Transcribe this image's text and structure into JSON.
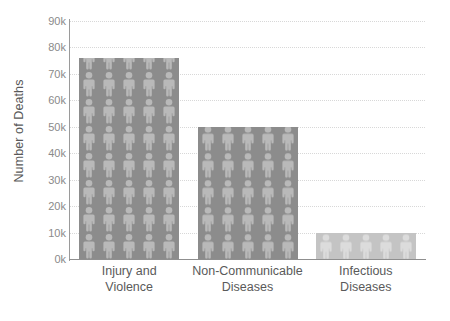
{
  "chart_data": {
    "type": "bar",
    "title": "",
    "subtitle": "",
    "xlabel": "",
    "ylabel": "Number of Deaths",
    "categories": [
      "Injury and Violence",
      "Non-Communicable Diseases",
      "Infectious Diseases"
    ],
    "category_lines": [
      [
        "Injury and",
        "Violence"
      ],
      [
        "Non-Communicable",
        "Diseases"
      ],
      [
        "Infectious",
        "Diseases"
      ]
    ],
    "values": [
      76000,
      50000,
      10000
    ],
    "value_labels": [
      "76k",
      "50k",
      "10k"
    ],
    "ylim": [
      0,
      90000
    ],
    "ytick_values": [
      0,
      10000,
      20000,
      30000,
      40000,
      50000,
      60000,
      70000,
      80000,
      90000
    ],
    "ytick_labels": [
      "0k",
      "10k",
      "20k",
      "30k",
      "40k",
      "50k",
      "60k",
      "70k",
      "80k",
      "90k"
    ],
    "grid": true,
    "grid_style": "dotted",
    "legend": false,
    "legend_position": "none",
    "bar_fill_pattern": "person-pictogram",
    "bar_colors": [
      "#8c8c8c",
      "#8c8c8c",
      "#c4c4c4"
    ],
    "pictogram_colors": [
      "#b9b9b9",
      "#b9b9b9",
      "#dcdcdc"
    ],
    "grid_color": "#d8d8d8",
    "axis_color": "#8f8f8f",
    "tick_label_color": "#8a8a8a",
    "axis_title_color": "#595959"
  }
}
